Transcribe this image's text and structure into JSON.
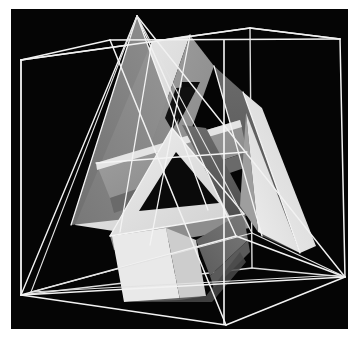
{
  "figure": {
    "kind": "3d-geometric-render",
    "canvas": {
      "width": 362,
      "height": 342
    },
    "plate": {
      "x": 11,
      "y": 9,
      "width": 337,
      "height": 320,
      "background": "#050505"
    },
    "page_background": "#ffffff",
    "palette": {
      "background": "#050505",
      "wire": "#f2f2f2",
      "wire_dim": "#b9b9b9",
      "face_white": "#ececec",
      "face_light": "#d7d7d7",
      "face_mid": "#9a9a9a",
      "face_mid_dark": "#7d7d7d",
      "face_dark": "#5e5e5e",
      "face_darker": "#3f3f3f",
      "face_black": "#0a0a0a"
    },
    "cube": {
      "label": "wireframe cube",
      "stroke": "#f2f2f2",
      "stroke_width": 1.5,
      "vertices": {
        "back_top_left": [
          21,
          60
        ],
        "back_top_right": [
          250,
          28
        ],
        "back_bottom_left": [
          21,
          295
        ],
        "back_bottom_right": [
          252,
          268
        ],
        "front_top_left": [
          110,
          40
        ],
        "front_top_right": [
          340,
          39
        ],
        "front_bottom_left": [
          112,
          300
        ],
        "front_bottom_right": [
          345,
          277
        ],
        "near_bottom": [
          226,
          325
        ]
      },
      "edges": [
        [
          "back_top_left",
          "front_top_left"
        ],
        [
          "front_top_left",
          "front_top_right"
        ],
        [
          "front_top_right",
          "back_top_right"
        ],
        [
          "back_top_right",
          "back_top_left"
        ],
        [
          "back_top_left",
          "back_bottom_left"
        ],
        [
          "front_top_right",
          "front_bottom_right"
        ],
        [
          "back_bottom_left",
          "near_bottom"
        ],
        [
          "near_bottom",
          "front_bottom_right"
        ],
        [
          "front_top_left",
          "near_bottom"
        ]
      ]
    },
    "tetrahedron": {
      "label": "wireframe tetrahedron",
      "stroke": "#f2f2f2",
      "stroke_width": 1.4,
      "vertices": {
        "apex": [
          137,
          16
        ],
        "left": [
          21,
          295
        ],
        "right": [
          345,
          277
        ],
        "front": [
          236,
          236
        ]
      },
      "edges": [
        [
          "apex",
          "left"
        ],
        [
          "apex",
          "right"
        ],
        [
          "apex",
          "front"
        ],
        [
          "left",
          "right"
        ],
        [
          "left",
          "front"
        ],
        [
          "front",
          "right"
        ]
      ]
    },
    "bands": {
      "label": "interwoven shaded polygon bands",
      "count": 3,
      "description": "three flat ribbons forming a triangular knot threading the tetrahedron"
    }
  }
}
